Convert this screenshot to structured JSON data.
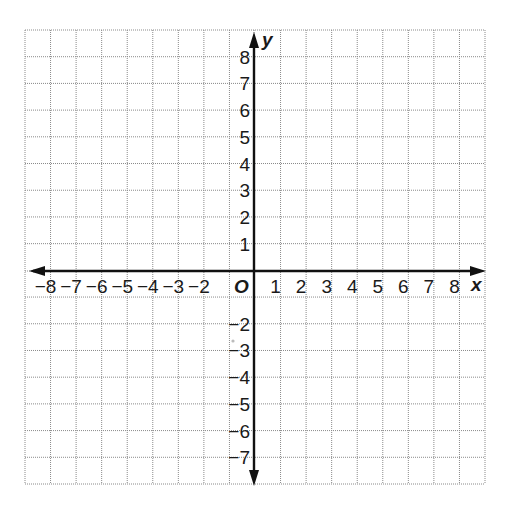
{
  "diagram": {
    "type": "coordinate-plane",
    "x_axis": {
      "name": "x",
      "min": -9,
      "max": 9,
      "tick_labels": [
        "−8",
        "−7",
        "−6",
        "−5",
        "−4",
        "−3",
        "−2",
        "1",
        "2",
        "3",
        "4",
        "5",
        "6",
        "7",
        "8"
      ],
      "tick_values": [
        -8,
        -7,
        -6,
        -5,
        -4,
        -3,
        -2,
        1,
        2,
        3,
        4,
        5,
        6,
        7,
        8
      ]
    },
    "y_axis": {
      "name": "y",
      "min": -8,
      "max": 9,
      "tick_labels": [
        "8",
        "7",
        "6",
        "5",
        "4",
        "3",
        "2",
        "1",
        "−2",
        "−3",
        "−4",
        "−5",
        "−6",
        "−7"
      ],
      "tick_values": [
        8,
        7,
        6,
        5,
        4,
        3,
        2,
        1,
        -2,
        -3,
        -4,
        -5,
        -6,
        -7
      ]
    },
    "origin_label": "O",
    "colors": {
      "grid": "#8a8a8a",
      "axis": "#111111",
      "text": "#1a1a1a",
      "background": "#ffffff"
    },
    "layout": {
      "left": 25,
      "right": 485,
      "top": 30,
      "bottom": 484,
      "axis_x_px": 254,
      "axis_y_px": 271
    }
  }
}
